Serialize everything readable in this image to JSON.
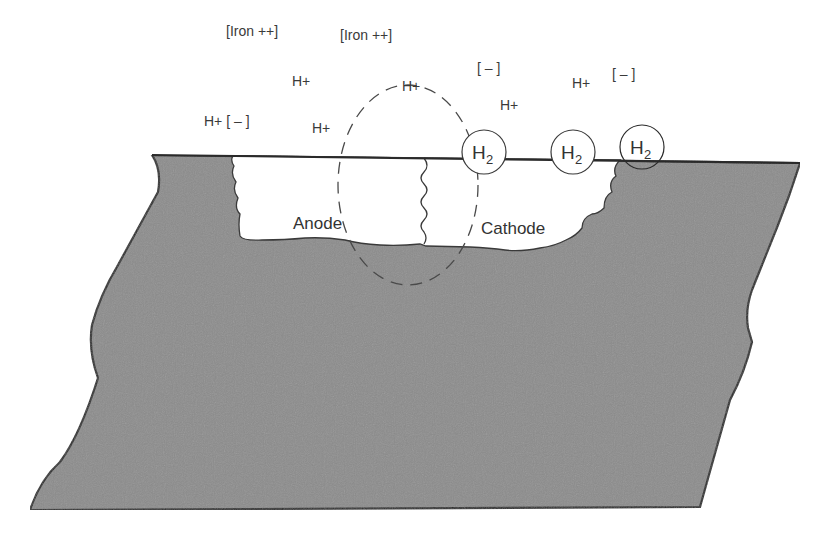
{
  "diagram": {
    "colors": {
      "metal_fill": "#8c8c8c",
      "outline": "#2a2a2a",
      "background": "#ffffff",
      "pit_fill": "#ffffff",
      "text": "#3a3a3a"
    },
    "ions": [
      {
        "id": "iron1",
        "text": "[Iron ++]",
        "x": 226,
        "y": 36
      },
      {
        "id": "iron2",
        "text": "[Iron ++]",
        "x": 340,
        "y": 40
      },
      {
        "id": "h1",
        "text": "H+",
        "x": 292,
        "y": 86
      },
      {
        "id": "h2",
        "text": "H+",
        "x": 402,
        "y": 91
      },
      {
        "id": "neg1",
        "text": "[ – ]",
        "x": 477,
        "y": 73
      },
      {
        "id": "h3",
        "text": "H+",
        "x": 572,
        "y": 88
      },
      {
        "id": "neg2",
        "text": "[ – ]",
        "x": 612,
        "y": 79
      },
      {
        "id": "h4",
        "text": "H+",
        "x": 500,
        "y": 110
      },
      {
        "id": "h5",
        "text": "H+ [ – ]",
        "x": 204,
        "y": 126
      },
      {
        "id": "h6",
        "text": "H+",
        "x": 312,
        "y": 133
      }
    ],
    "bubbles": [
      {
        "id": "bubble1",
        "label": "H",
        "sub": "2",
        "cx": 484,
        "cy": 152,
        "r": 22
      },
      {
        "id": "bubble2",
        "label": "H",
        "sub": "2",
        "cx": 573,
        "cy": 152,
        "r": 22
      },
      {
        "id": "bubble3",
        "label": "H",
        "sub": "2",
        "cx": 642,
        "cy": 147,
        "r": 22
      }
    ],
    "zones": {
      "anode": {
        "text": "Anode",
        "x": 293,
        "y": 229
      },
      "cathode": {
        "text": "Cathode",
        "x": 481,
        "y": 234
      }
    }
  }
}
